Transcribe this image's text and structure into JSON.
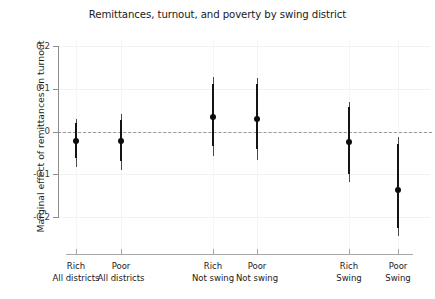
{
  "chart_data": {
    "type": "scatter",
    "title": "Remittances, turnout, and poverty by swing district",
    "xlabel": "",
    "ylabel": "Marginal effect of remittances on turnout",
    "ylim": [
      -0.245,
      0.2
    ],
    "yticks": [
      0.2,
      0.1,
      0,
      -0.1,
      -0.2
    ],
    "ytick_labels": [
      "0.2",
      "0.1",
      "0",
      "-0.1",
      "-0.2"
    ],
    "grid": true,
    "legend": "none",
    "reference_line": {
      "y": 0,
      "style": "dashed",
      "color": "#9a9a9a"
    },
    "categories": [
      {
        "line1": "Rich",
        "line2": "All districts"
      },
      {
        "line1": "Poor",
        "line2": "All districts"
      },
      {
        "line1": "Rich",
        "line2": "Not swing"
      },
      {
        "line1": "Poor",
        "line2": "Not swing"
      },
      {
        "line1": "Rich",
        "line2": "Swing"
      },
      {
        "line1": "Poor",
        "line2": "Swing"
      }
    ],
    "points": [
      {
        "category": "Rich All districts",
        "estimate": -0.023,
        "ci_inner_low": -0.063,
        "ci_inner_high": 0.02,
        "ci_outer_low": -0.083,
        "ci_outer_high": 0.029
      },
      {
        "category": "Poor All districts",
        "estimate": -0.022,
        "ci_inner_low": -0.069,
        "ci_inner_high": 0.027,
        "ci_outer_low": -0.09,
        "ci_outer_high": 0.042
      },
      {
        "category": "Rich Not swing",
        "estimate": 0.035,
        "ci_inner_low": -0.035,
        "ci_inner_high": 0.112,
        "ci_outer_low": -0.058,
        "ci_outer_high": 0.127
      },
      {
        "category": "Poor Not swing",
        "estimate": 0.03,
        "ci_inner_low": -0.042,
        "ci_inner_high": 0.111,
        "ci_outer_low": -0.066,
        "ci_outer_high": 0.126
      },
      {
        "category": "Rich Swing",
        "estimate": -0.024,
        "ci_inner_low": -0.1,
        "ci_inner_high": 0.057,
        "ci_outer_low": -0.119,
        "ci_outer_high": 0.069
      },
      {
        "category": "Poor Swing",
        "estimate": -0.137,
        "ci_inner_low": -0.225,
        "ci_inner_high": -0.03,
        "ci_outer_low": -0.245,
        "ci_outer_high": -0.014
      }
    ]
  }
}
